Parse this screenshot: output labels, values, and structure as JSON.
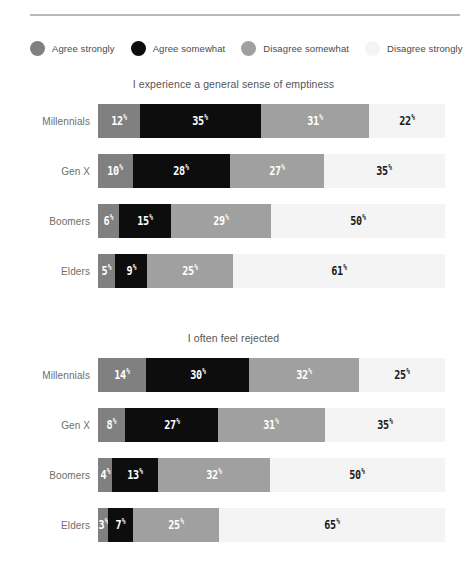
{
  "legend": {
    "items": [
      {
        "label": "Agree strongly",
        "color": "#808080"
      },
      {
        "label": "Agree somewhat",
        "color": "#0d0d0d"
      },
      {
        "label": "Disagree somewhat",
        "color": "#a0a0a0"
      },
      {
        "label": "Disagree strongly",
        "color": "#f4f4f4"
      }
    ]
  },
  "chart_data": [
    {
      "type": "bar",
      "title": "I experience a general sense of emptiness",
      "orientation": "horizontal",
      "stacked": true,
      "normalized": "100%",
      "xlabel": "",
      "ylabel": "",
      "xlim": [
        0,
        100
      ],
      "grid": false,
      "legend_position": "top",
      "categories": [
        "Millennials",
        "Gen X",
        "Boomers",
        "Elders"
      ],
      "series": [
        {
          "name": "Agree strongly",
          "color": "#808080",
          "values": [
            12,
            10,
            6,
            5
          ]
        },
        {
          "name": "Agree somewhat",
          "color": "#0d0d0d",
          "values": [
            35,
            28,
            15,
            9
          ]
        },
        {
          "name": "Disagree somewhat",
          "color": "#a0a0a0",
          "values": [
            31,
            27,
            29,
            25
          ]
        },
        {
          "name": "Disagree strongly",
          "color": "#f4f4f4",
          "values": [
            22,
            35,
            50,
            61
          ]
        }
      ],
      "rows": [
        {
          "category": "Millennials",
          "segments": [
            {
              "value": 12,
              "label": "12",
              "suffix": "%",
              "color": "#808080",
              "text": "light"
            },
            {
              "value": 35,
              "label": "35",
              "suffix": "%",
              "color": "#0d0d0d",
              "text": "light"
            },
            {
              "value": 31,
              "label": "31",
              "suffix": "%",
              "color": "#a0a0a0",
              "text": "light"
            },
            {
              "value": 22,
              "label": "22",
              "suffix": "%",
              "color": "#f4f4f4",
              "text": "dark"
            }
          ]
        },
        {
          "category": "Gen X",
          "segments": [
            {
              "value": 10,
              "label": "10",
              "suffix": "%",
              "color": "#808080",
              "text": "light"
            },
            {
              "value": 28,
              "label": "28",
              "suffix": "%",
              "color": "#0d0d0d",
              "text": "light"
            },
            {
              "value": 27,
              "label": "27",
              "suffix": "%",
              "color": "#a0a0a0",
              "text": "light"
            },
            {
              "value": 35,
              "label": "35",
              "suffix": "%",
              "color": "#f4f4f4",
              "text": "dark"
            }
          ]
        },
        {
          "category": "Boomers",
          "segments": [
            {
              "value": 6,
              "label": "6",
              "suffix": "%",
              "color": "#808080",
              "text": "light"
            },
            {
              "value": 15,
              "label": "15",
              "suffix": "%",
              "color": "#0d0d0d",
              "text": "light"
            },
            {
              "value": 29,
              "label": "29",
              "suffix": "%",
              "color": "#a0a0a0",
              "text": "light"
            },
            {
              "value": 50,
              "label": "50",
              "suffix": "%",
              "color": "#f4f4f4",
              "text": "dark"
            }
          ]
        },
        {
          "category": "Elders",
          "segments": [
            {
              "value": 5,
              "label": "5",
              "suffix": "%",
              "color": "#808080",
              "text": "light"
            },
            {
              "value": 9,
              "label": "9",
              "suffix": "%",
              "color": "#0d0d0d",
              "text": "light"
            },
            {
              "value": 25,
              "label": "25",
              "suffix": "%",
              "color": "#a0a0a0",
              "text": "light"
            },
            {
              "value": 61,
              "label": "61",
              "suffix": "%",
              "color": "#f4f4f4",
              "text": "dark"
            }
          ]
        }
      ]
    },
    {
      "type": "bar",
      "title": "I often feel rejected",
      "orientation": "horizontal",
      "stacked": true,
      "normalized": "100%",
      "xlabel": "",
      "ylabel": "",
      "xlim": [
        0,
        100
      ],
      "grid": false,
      "legend_position": "top",
      "categories": [
        "Millennials",
        "Gen X",
        "Boomers",
        "Elders"
      ],
      "series": [
        {
          "name": "Agree strongly",
          "color": "#808080",
          "values": [
            14,
            8,
            4,
            3
          ]
        },
        {
          "name": "Agree somewhat",
          "color": "#0d0d0d",
          "values": [
            30,
            27,
            13,
            7
          ]
        },
        {
          "name": "Disagree somewhat",
          "color": "#a0a0a0",
          "values": [
            32,
            31,
            32,
            25
          ]
        },
        {
          "name": "Disagree strongly",
          "color": "#f4f4f4",
          "values": [
            25,
            35,
            50,
            65
          ]
        }
      ],
      "rows": [
        {
          "category": "Millennials",
          "segments": [
            {
              "value": 14,
              "label": "14",
              "suffix": "%",
              "color": "#808080",
              "text": "light"
            },
            {
              "value": 30,
              "label": "30",
              "suffix": "%",
              "color": "#0d0d0d",
              "text": "light"
            },
            {
              "value": 32,
              "label": "32",
              "suffix": "%",
              "color": "#a0a0a0",
              "text": "light"
            },
            {
              "value": 25,
              "label": "25",
              "suffix": "%",
              "color": "#f4f4f4",
              "text": "dark"
            }
          ]
        },
        {
          "category": "Gen X",
          "segments": [
            {
              "value": 8,
              "label": "8",
              "suffix": "%",
              "color": "#808080",
              "text": "light"
            },
            {
              "value": 27,
              "label": "27",
              "suffix": "%",
              "color": "#0d0d0d",
              "text": "light"
            },
            {
              "value": 31,
              "label": "31",
              "suffix": "%",
              "color": "#a0a0a0",
              "text": "light"
            },
            {
              "value": 35,
              "label": "35",
              "suffix": "%",
              "color": "#f4f4f4",
              "text": "dark"
            }
          ]
        },
        {
          "category": "Boomers",
          "segments": [
            {
              "value": 4,
              "label": "4",
              "suffix": "%",
              "color": "#808080",
              "text": "light"
            },
            {
              "value": 13,
              "label": "13",
              "suffix": "%",
              "color": "#0d0d0d",
              "text": "light"
            },
            {
              "value": 32,
              "label": "32",
              "suffix": "%",
              "color": "#a0a0a0",
              "text": "light"
            },
            {
              "value": 50,
              "label": "50",
              "suffix": "%",
              "color": "#f4f4f4",
              "text": "dark"
            }
          ]
        },
        {
          "category": "Elders",
          "segments": [
            {
              "value": 3,
              "label": "3",
              "suffix": "%",
              "color": "#808080",
              "text": "light"
            },
            {
              "value": 7,
              "label": "7",
              "suffix": "%",
              "color": "#0d0d0d",
              "text": "light"
            },
            {
              "value": 25,
              "label": "25",
              "suffix": "%",
              "color": "#a0a0a0",
              "text": "light"
            },
            {
              "value": 65,
              "label": "65",
              "suffix": "%",
              "color": "#f4f4f4",
              "text": "dark"
            }
          ]
        }
      ]
    }
  ]
}
